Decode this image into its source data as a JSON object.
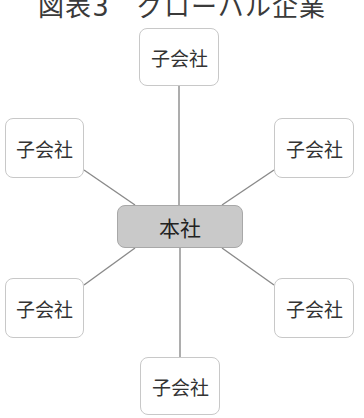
{
  "title": "図表3　グローバル企業",
  "colors": {
    "line": "#8a8a8a",
    "hq_fill": "#c9c9c9",
    "sub_border": "#c8c8c8"
  },
  "headquarters": {
    "label": "本社"
  },
  "subsidiaries": [
    {
      "label": "子会社",
      "position": "top"
    },
    {
      "label": "子会社",
      "position": "upper-left"
    },
    {
      "label": "子会社",
      "position": "upper-right"
    },
    {
      "label": "子会社",
      "position": "lower-left"
    },
    {
      "label": "子会社",
      "position": "lower-right"
    },
    {
      "label": "子会社",
      "position": "bottom"
    }
  ]
}
